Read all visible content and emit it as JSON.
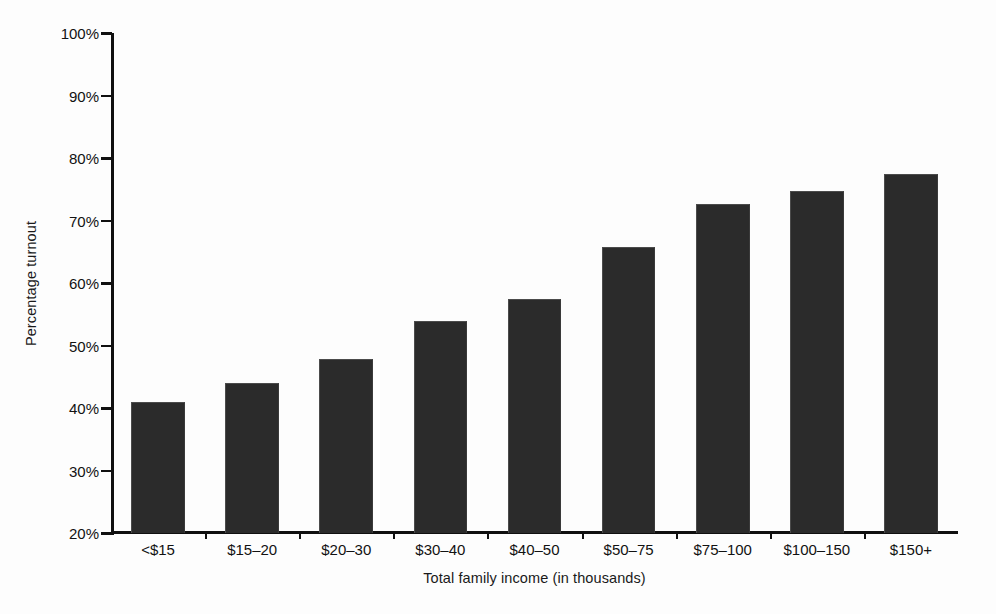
{
  "chart_data": {
    "type": "bar",
    "title": "",
    "subtitle": "",
    "xlabel": "Total family income (in thousands)",
    "ylabel": "Percentage turnout",
    "categories": [
      "<$15",
      "$15–20",
      "$20–30",
      "$30–40",
      "$40–50",
      "$50–75",
      "$75–100",
      "$100–150",
      "$150+"
    ],
    "values": [
      41.0,
      44.0,
      47.8,
      53.9,
      57.5,
      65.7,
      72.7,
      74.7,
      77.4
    ],
    "value_labels": [
      "41%",
      "44%",
      "47.8%",
      "53.9%",
      "57.5%",
      "65.7%",
      "72.7%",
      "74.7%",
      "77.4%"
    ],
    "series": [
      {
        "name": "Percentage turnout",
        "values": [
          41.0,
          44.0,
          47.8,
          53.9,
          57.5,
          65.7,
          72.7,
          74.7,
          77.4
        ]
      }
    ],
    "ylim": [
      20,
      100
    ],
    "xlim": [
      0,
      9
    ],
    "ytick_values": [
      20,
      30,
      40,
      50,
      60,
      70,
      80,
      90,
      100
    ],
    "ytick_labels": [
      "20%",
      "30%",
      "40%",
      "50%",
      "60%",
      "70%",
      "80%",
      "90%",
      "100%"
    ],
    "grid": false,
    "legend": false,
    "legend_position": "none",
    "bar_color": "#2b2b2b",
    "bar_edge_color": "#4b4b4b",
    "axis_color": "#101010",
    "background_color": "#fdfdfd",
    "bar_width_fraction": 0.57,
    "orientation": "vertical"
  }
}
